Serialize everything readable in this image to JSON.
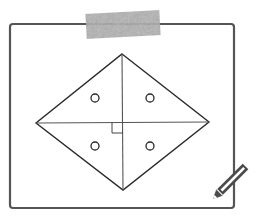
{
  "colors": {
    "background": "#ffffff",
    "frame_stroke": "#555555",
    "diagram_stroke": "#2a2a2a",
    "tape_fill": "#a8a8a8",
    "pencil_stroke": "#4a4a4a"
  },
  "frame": {
    "x": 10,
    "y": 24,
    "width": 224,
    "height": 184,
    "radius": 3
  },
  "tape": {
    "x": 86,
    "y": 12,
    "width": 74,
    "height": 25,
    "rotation": -3
  },
  "diamond": {
    "top": [
      122,
      54
    ],
    "right": [
      209,
      122
    ],
    "bottom": [
      123,
      190
    ],
    "left": [
      36,
      123
    ],
    "center": [
      123,
      122
    ]
  },
  "right_angle_marker": {
    "x": 112,
    "y": 122,
    "size": 11
  },
  "holes": [
    {
      "cx": 95,
      "cy": 98,
      "r": 4
    },
    {
      "cx": 150,
      "cy": 98,
      "r": 4
    },
    {
      "cx": 95,
      "cy": 146,
      "r": 4
    },
    {
      "cx": 150,
      "cy": 146,
      "r": 4
    }
  ],
  "icons": {
    "pencil": "pencil-icon",
    "tape": "tape-strip"
  }
}
